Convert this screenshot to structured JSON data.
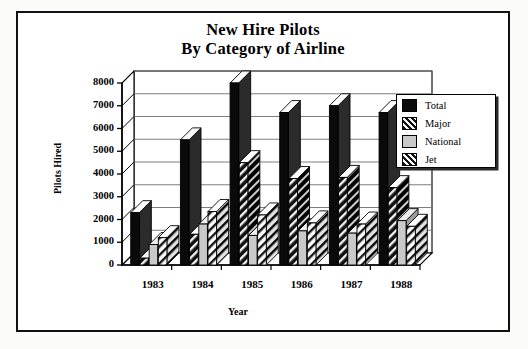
{
  "chart_data": {
    "type": "bar",
    "title": "New Hire Pilots By Category of Airline",
    "title_line1": "New Hire Pilots",
    "title_line2": "By Category of Airline",
    "xlabel": "Year",
    "ylabel": "Pilots Hired",
    "categories": [
      "1983",
      "1984",
      "1985",
      "1986",
      "1987",
      "1988"
    ],
    "ylim": [
      0,
      8000
    ],
    "yticks": [
      0,
      1000,
      2000,
      3000,
      4000,
      5000,
      6000,
      7000,
      8000
    ],
    "ytick_labels": [
      "0",
      "1000",
      "2000",
      "3000",
      "4000",
      "5000",
      "6000",
      "7000",
      "8000"
    ],
    "grid": true,
    "legend_position": "top-right",
    "style": "3d-column",
    "series": [
      {
        "name": "Total",
        "swatch": "#000000",
        "pattern": "solid",
        "values": [
          2300,
          5500,
          8000,
          6700,
          7000,
          6700
        ]
      },
      {
        "name": "Major",
        "swatch": "#1a1a1a",
        "pattern": "dark-hatch",
        "values": [
          300,
          1350,
          4500,
          3800,
          3850,
          3400
        ]
      },
      {
        "name": "National",
        "swatch": "#c6c6c6",
        "pattern": "light-solid",
        "values": [
          900,
          1800,
          1300,
          1500,
          1400,
          1950
        ]
      },
      {
        "name": "Jet",
        "swatch": "#ffffff",
        "pattern": "light-hatch",
        "values": [
          1200,
          2350,
          2200,
          1850,
          1800,
          1700
        ]
      }
    ]
  },
  "legend": {
    "items": [
      {
        "label": "Total"
      },
      {
        "label": "Major"
      },
      {
        "label": "National"
      },
      {
        "label": "Jet"
      }
    ]
  }
}
